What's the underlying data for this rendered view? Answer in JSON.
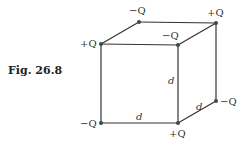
{
  "figure": {
    "caption": "Fig. 26.8",
    "charges": {
      "front_top_left": "+Q",
      "back_top_left": "−Q",
      "back_top_right": "+Q",
      "front_top_right": "−Q",
      "front_bottom_left": "−Q",
      "front_bottom_right": "+Q",
      "back_bottom_right": "−Q"
    },
    "edge_labels": {
      "vertical": "d",
      "horizontal": "d",
      "depth": "d"
    },
    "colors": {
      "line": "#333333",
      "dot": "#444444"
    }
  }
}
